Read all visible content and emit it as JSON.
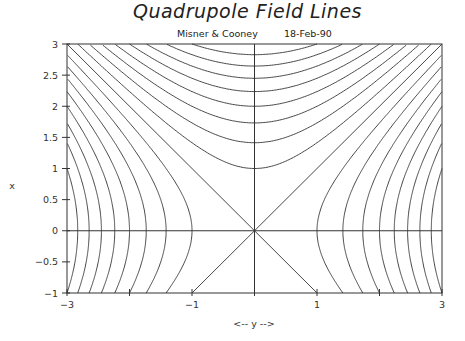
{
  "header": {
    "title": "Quadrupole Field Lines",
    "author": "Misner & Cooney",
    "date": "18-Feb-90"
  },
  "chart_data": {
    "type": "line",
    "title": "Quadrupole Field Lines",
    "subtitle": [
      "Misner & Cooney",
      "18-Feb-90"
    ],
    "xlabel": "<-- y -->",
    "ylabel": "x",
    "xlim": [
      -3,
      3
    ],
    "ylim": [
      -1,
      3
    ],
    "xticks": [
      -3,
      -2,
      -1,
      0,
      1,
      2,
      3
    ],
    "xtick_labels": [
      "-3",
      "",
      "-1",
      "",
      "1",
      "",
      "3"
    ],
    "yticks": [
      -1,
      -0.5,
      0,
      0.5,
      1,
      1.5,
      2,
      2.5,
      3
    ],
    "ytick_labels": [
      "-1",
      "-0.5",
      "0",
      "0.5",
      "1",
      "1.5",
      "2",
      "2.5",
      "3"
    ],
    "grid": false,
    "legend": null,
    "axes_lines": {
      "horizontal_at_x": 0,
      "vertical_at_y": 0
    },
    "series": [
      {
        "name": "x^2 - y^2 = c (top family)",
        "equation": "x^2 - y^2 = c",
        "c_values": [
          1,
          2,
          3,
          4,
          5,
          6,
          7,
          8
        ]
      },
      {
        "name": "y^2 - x^2 = c (side families)",
        "equation": "y^2 - x^2 = c",
        "c_values": [
          1,
          2,
          3,
          4,
          5,
          6,
          7,
          8
        ]
      },
      {
        "name": "asymptotes",
        "equation": "x = ±y",
        "c_values": [
          0
        ]
      }
    ]
  },
  "colors": {
    "line": "#333333",
    "background": "#ffffff"
  }
}
